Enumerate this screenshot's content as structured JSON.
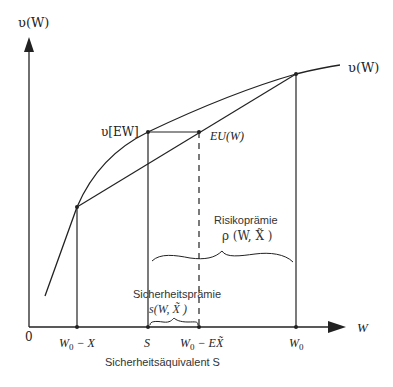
{
  "diagram": {
    "y_axis_label": "υ(W)",
    "x_axis_label": "W",
    "origin_label": "0",
    "curve_label": "υ(W)",
    "points": {
      "v_ew_label": "υ[EW]",
      "eu_label": "EU(W)"
    },
    "x_ticks": [
      {
        "label": "W0 − X",
        "main": "W",
        "sub": "0",
        "rest": " − X"
      },
      {
        "label": "S",
        "main": "S",
        "sub": "",
        "rest": ""
      },
      {
        "label": "W0 − EX̃",
        "main": "W",
        "sub": "0",
        "rest": " − EX̃"
      },
      {
        "label": "W0",
        "main": "W",
        "sub": "0",
        "rest": ""
      }
    ],
    "annotations": {
      "risk_premium_title": "Risikoprämie",
      "risk_premium_formula": "ρ (W, X̃ )",
      "safety_premium_title": "Sicherheitsprämie",
      "safety_premium_formula": "s(W, X̃ )",
      "certainty_equivalent": "Sicherheitsäquivalent S"
    },
    "colors": {
      "line": "#222222",
      "text": "#222222",
      "background": "#ffffff"
    }
  }
}
